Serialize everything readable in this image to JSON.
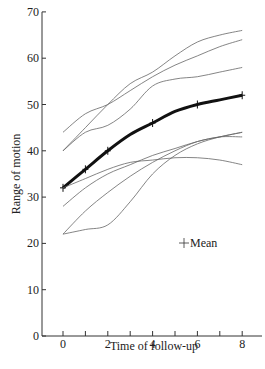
{
  "chart_data": {
    "type": "line",
    "title": "",
    "xlabel": "Time of follow-up",
    "ylabel": "Range of motion",
    "xlim": [
      -1.0,
      9.0
    ],
    "ylim": [
      0,
      70
    ],
    "x_ticks": [
      0,
      1,
      2,
      3,
      4,
      5,
      6,
      7,
      8
    ],
    "x_tick_labels": [
      "0",
      "2",
      "4",
      "6",
      "8"
    ],
    "y_ticks": [
      0,
      10,
      20,
      30,
      40,
      50,
      60,
      70
    ],
    "y_tick_labels": [
      "0",
      "10",
      "20",
      "30",
      "40",
      "50",
      "60",
      "70"
    ],
    "grid": false,
    "legend": {
      "position": "inside-right",
      "entries": [
        "Mean"
      ],
      "marker": "+"
    },
    "x": [
      0,
      1,
      2,
      3,
      4,
      5,
      6,
      7,
      8
    ],
    "series": [
      {
        "name": "Mean",
        "style": "thick",
        "markers": [
          0,
          1,
          2,
          4,
          6,
          8
        ],
        "values": [
          32,
          36,
          40,
          43.5,
          46,
          48.5,
          50,
          51,
          52
        ]
      },
      {
        "name": "Subject 1",
        "values": [
          44,
          48,
          50,
          53,
          56,
          58.5,
          60.5,
          62.5,
          64
        ]
      },
      {
        "name": "Subject 2",
        "values": [
          40,
          45,
          50,
          54.5,
          57,
          60.5,
          63.5,
          65,
          66
        ]
      },
      {
        "name": "Subject 3",
        "values": [
          40,
          44,
          45.5,
          49,
          54,
          55.5,
          56,
          57,
          58
        ]
      },
      {
        "name": "Subject 4",
        "values": [
          32,
          34,
          36,
          37.5,
          38,
          38.5,
          38.5,
          38,
          37
        ]
      },
      {
        "name": "Subject 5",
        "values": [
          28,
          32,
          35,
          37,
          39,
          40.5,
          42,
          43,
          43
        ]
      },
      {
        "name": "Subject 6",
        "values": [
          22,
          27,
          31,
          34.5,
          37.5,
          40,
          42,
          43,
          44
        ]
      },
      {
        "name": "Subject 7",
        "values": [
          22,
          23,
          24,
          29,
          35,
          39,
          41.5,
          43,
          44
        ]
      }
    ]
  },
  "legend_label": "Mean"
}
